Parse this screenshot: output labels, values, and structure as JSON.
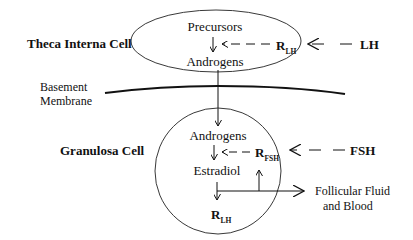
{
  "diagram": {
    "theca": {
      "label": "Theca Interna Cell",
      "precursors": "Precursors",
      "androgens": "Androgens",
      "receptor": "R",
      "receptor_sub": "LH",
      "hormone": "LH"
    },
    "membrane": {
      "line1": "Basement",
      "line2": "Membrane"
    },
    "granulosa": {
      "label": "Granulosa Cell",
      "androgens": "Androgens",
      "estradiol": "Estradiol",
      "receptor_fsh": "R",
      "receptor_fsh_sub": "FSH",
      "receptor_lh": "R",
      "receptor_lh_sub": "LH",
      "hormone": "FSH",
      "output_line1": "Follicular Fluid",
      "output_line2": "and Blood"
    },
    "colors": {
      "stroke": "#111111",
      "background": "#ffffff"
    }
  }
}
